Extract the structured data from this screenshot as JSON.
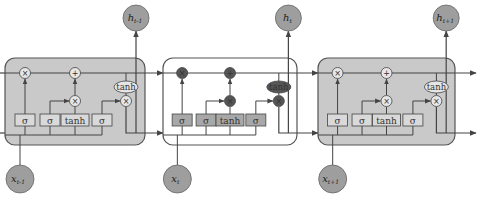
{
  "colors": {
    "cell_fill_outer": "#c9c9c9",
    "cell_fill_center": "#ffffff",
    "cell_border": "#555555",
    "node_fill": "#9e9e9e",
    "gate_fill_outer": "#d9d9d9",
    "gate_fill_center": "#a8a8a8",
    "op_fill_outer": "#e6e6e6",
    "op_fill_center": "#555555",
    "line": "#444444"
  },
  "cells": [
    {
      "id": "cell-prev",
      "highlighted": false,
      "input_label": "x",
      "input_sub": "t-1",
      "output_label": "h",
      "output_sub": "t-1"
    },
    {
      "id": "cell-current",
      "highlighted": true,
      "input_label": "x",
      "input_sub": "t",
      "output_label": "h",
      "output_sub": "t"
    },
    {
      "id": "cell-next",
      "highlighted": false,
      "input_label": "x",
      "input_sub": "t+1",
      "output_label": "h",
      "output_sub": "t+1"
    }
  ],
  "gates": [
    "σ",
    "σ",
    "tanh",
    "σ"
  ],
  "ops": {
    "multiply": "×",
    "add": "+",
    "tanh": "tanh"
  }
}
